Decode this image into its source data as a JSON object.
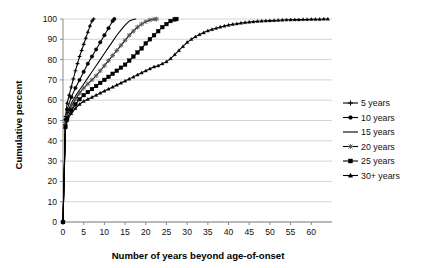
{
  "chart_data": {
    "type": "line",
    "title": "",
    "xlabel": "Number of years beyond age-of-onset",
    "ylabel": "Cumulative percent",
    "xlim": [
      0,
      65
    ],
    "ylim": [
      0,
      100
    ],
    "xticks": [
      0,
      5,
      10,
      15,
      20,
      25,
      30,
      35,
      40,
      45,
      50,
      55,
      60
    ],
    "yticks": [
      0,
      10,
      20,
      30,
      40,
      50,
      60,
      70,
      80,
      90,
      100
    ],
    "xtick_labels": [
      "0",
      "5",
      "10",
      "15",
      "20",
      "25",
      "30",
      "35",
      "40",
      "45",
      "50",
      "55",
      "60"
    ],
    "ytick_labels": [
      "0",
      "10",
      "20",
      "30",
      "40",
      "50",
      "60",
      "70",
      "80",
      "90",
      "100"
    ],
    "grid": "horizontal",
    "legend_position": "right",
    "legend_entries": [
      "5 years",
      "10 years",
      "15 years",
      "20 years",
      "25 years",
      "30+ years"
    ],
    "series": [
      {
        "name": "5 years",
        "marker": "cross",
        "x": [
          0,
          0.6,
          1,
          1.5,
          2,
          2.5,
          3,
          3.5,
          4,
          4.5,
          5,
          5.5,
          6,
          6.5,
          7,
          7.4
        ],
        "y": [
          0,
          52,
          58.5,
          62.5,
          66.5,
          70.5,
          74.5,
          78,
          81.5,
          84.5,
          87.5,
          90.5,
          93.5,
          96.5,
          99,
          100
        ]
      },
      {
        "name": "10 years",
        "marker": "circle",
        "x": [
          0,
          0.6,
          1,
          2,
          3,
          4,
          5,
          6,
          7,
          8,
          9,
          10,
          11,
          12,
          12.4
        ],
        "y": [
          0,
          50.5,
          55.5,
          61.5,
          66,
          70,
          74,
          78,
          81.5,
          85,
          88.5,
          92,
          95.5,
          99,
          100
        ]
      },
      {
        "name": "15 years",
        "marker": "none",
        "x": [
          0,
          0.6,
          1,
          2,
          3,
          4,
          5,
          6,
          7,
          8,
          9,
          10,
          11,
          12,
          13,
          14,
          15,
          16,
          17,
          17.6
        ],
        "y": [
          0,
          49.5,
          53.5,
          58.5,
          62,
          65,
          68,
          71,
          74,
          77,
          80,
          83,
          86,
          89,
          92,
          94.5,
          97,
          99,
          99.8,
          100
        ]
      },
      {
        "name": "20 years",
        "marker": "star",
        "x": [
          0,
          0.6,
          1,
          2,
          3,
          4,
          5,
          6,
          7,
          8,
          9,
          10,
          11,
          12,
          13,
          14,
          15,
          16,
          17,
          18,
          19,
          20,
          21,
          22,
          22.6
        ],
        "y": [
          0,
          49,
          52.5,
          57,
          60.5,
          63.5,
          66,
          68,
          70,
          72,
          74.5,
          77,
          79.5,
          82,
          84.5,
          87,
          89.5,
          92,
          94,
          96,
          97.5,
          98.7,
          99.5,
          99.9,
          100
        ]
      },
      {
        "name": "25 years",
        "marker": "square",
        "x": [
          0,
          0.6,
          1,
          2,
          3,
          4,
          5,
          6,
          7,
          8,
          9,
          10,
          11,
          12,
          13,
          14,
          15,
          16,
          17,
          18,
          19,
          20,
          21,
          22,
          23,
          24,
          25,
          26,
          27,
          27.4
        ],
        "y": [
          0,
          47,
          51,
          55,
          58,
          60.5,
          62.5,
          64,
          65.5,
          67,
          68.5,
          70,
          71.5,
          73,
          74.5,
          76,
          77.5,
          79.5,
          81.5,
          83.5,
          85.5,
          88,
          90,
          92,
          94,
          96,
          97.5,
          99,
          99.8,
          100
        ]
      },
      {
        "name": "30+ years",
        "marker": "triangle",
        "x": [
          0,
          0.6,
          1,
          2,
          3,
          4,
          5,
          6,
          7,
          8,
          9,
          10,
          11,
          12,
          13,
          14,
          15,
          16,
          17,
          18,
          19,
          20,
          21,
          22,
          23,
          24,
          25,
          26,
          27,
          28,
          29,
          30,
          31,
          32,
          33,
          34,
          35,
          36,
          37,
          38,
          39,
          40,
          41,
          42,
          43,
          44,
          45,
          46,
          47,
          48,
          49,
          50,
          51,
          52,
          53,
          54,
          55,
          56,
          57,
          58,
          59,
          60,
          61,
          62,
          63,
          64
        ],
        "y": [
          0,
          46.5,
          50,
          53.5,
          56,
          58,
          59.5,
          60.5,
          61.5,
          62.5,
          63.5,
          64.5,
          65.5,
          66.5,
          67.5,
          68.5,
          69.5,
          70.5,
          71.5,
          72.5,
          73.5,
          74.5,
          75.5,
          76.5,
          77,
          78,
          79,
          80.5,
          82.5,
          84.5,
          86.5,
          88.5,
          90,
          91.3,
          92.4,
          93.3,
          94.2,
          94.9,
          95.5,
          96.1,
          96.6,
          97.0,
          97.4,
          97.7,
          98.0,
          98.3,
          98.5,
          98.7,
          98.9,
          99.0,
          99.1,
          99.2,
          99.3,
          99.4,
          99.5,
          99.6,
          99.6,
          99.7,
          99.7,
          99.8,
          99.8,
          99.9,
          99.9,
          99.9,
          100,
          100
        ]
      }
    ]
  },
  "legend": {
    "items": [
      {
        "label": "5 years",
        "marker": "cross"
      },
      {
        "label": "10 years",
        "marker": "circle"
      },
      {
        "label": "15 years",
        "marker": "none"
      },
      {
        "label": "20 years",
        "marker": "star"
      },
      {
        "label": "25 years",
        "marker": "square"
      },
      {
        "label": "30+ years",
        "marker": "triangle"
      }
    ]
  },
  "colors": {
    "series": "#000000",
    "grid": "#c9c9c9",
    "axis": "#8a8a8a",
    "background": "#ffffff",
    "text": "#111111"
  }
}
